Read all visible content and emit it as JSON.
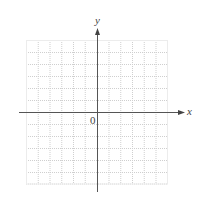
{
  "diagram": {
    "type": "coordinate-grid",
    "x_axis_label": "x",
    "y_axis_label": "y",
    "origin_label": "0",
    "grid": {
      "columns": 12,
      "rows": 12,
      "line_style": "dotted"
    },
    "colors": {
      "grid": "#c8c8c8",
      "axis": "#555555",
      "text": "#444444"
    }
  }
}
